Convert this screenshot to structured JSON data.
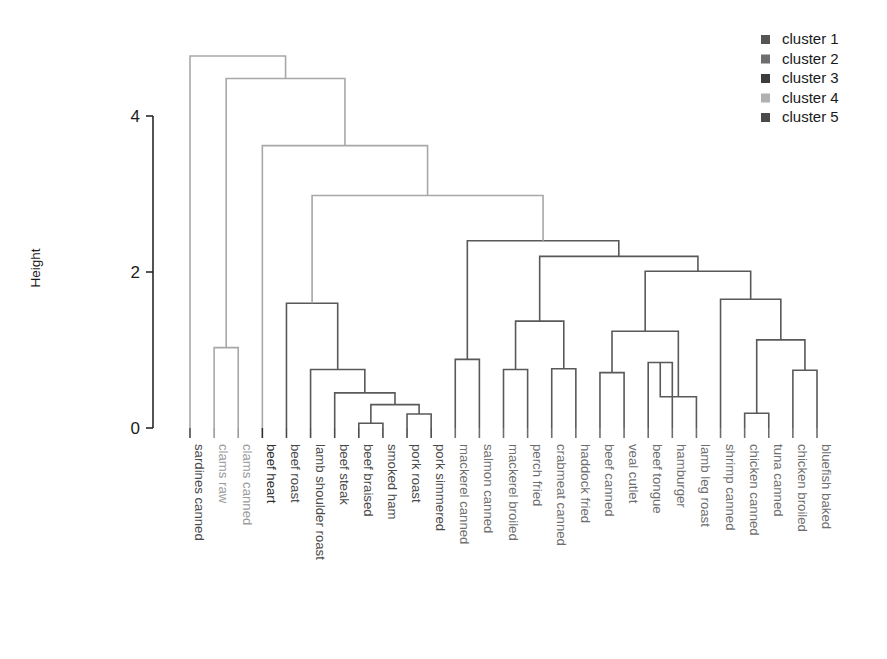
{
  "chart_data": {
    "type": "dendrogram",
    "title": "",
    "xlabel": "",
    "ylabel": "Height",
    "ylim": [
      0,
      5.0
    ],
    "yticks": [
      0,
      2,
      4
    ],
    "ytick_labels": [
      "0",
      "2",
      "4"
    ],
    "grid": false,
    "legend_position": "top-right",
    "cluster_colors": {
      "cluster 1": "#555555",
      "cluster 2": "#6e6e6e",
      "cluster 3": "#3c3c3c",
      "cluster 4": "#b0b0b0",
      "cluster 5": "#4a4a4a",
      "link_upper": "#a8a8a8",
      "link_lower": "#595959"
    },
    "legend": [
      {
        "label": "cluster 1",
        "color": "#555555"
      },
      {
        "label": "cluster 2",
        "color": "#6e6e6e"
      },
      {
        "label": "cluster 3",
        "color": "#3c3c3c"
      },
      {
        "label": "cluster 4",
        "color": "#b0b0b0"
      },
      {
        "label": "cluster 5",
        "color": "#4a4a4a"
      }
    ],
    "leaves": [
      {
        "label": "sardines canned",
        "cluster": 1,
        "color": "#4a4a4a"
      },
      {
        "label": "clams raw",
        "cluster": 4,
        "color": "#9a9a9a"
      },
      {
        "label": "clams canned",
        "cluster": 4,
        "color": "#9a9a9a"
      },
      {
        "label": "beef heart",
        "cluster": 3,
        "color": "#2e2e2e"
      },
      {
        "label": "beef roast",
        "cluster": 1,
        "color": "#4a4a4a"
      },
      {
        "label": "lamb shoulder roast",
        "cluster": 1,
        "color": "#4a4a4a"
      },
      {
        "label": "beef steak",
        "cluster": 1,
        "color": "#4a4a4a"
      },
      {
        "label": "beef braised",
        "cluster": 1,
        "color": "#4a4a4a"
      },
      {
        "label": "smoked ham",
        "cluster": 1,
        "color": "#4a4a4a"
      },
      {
        "label": "pork roast",
        "cluster": 1,
        "color": "#4a4a4a"
      },
      {
        "label": "pork simmered",
        "cluster": 1,
        "color": "#4a4a4a"
      },
      {
        "label": "mackerel canned",
        "cluster": 2,
        "color": "#6e6e6e"
      },
      {
        "label": "salmon canned",
        "cluster": 2,
        "color": "#6e6e6e"
      },
      {
        "label": "mackerel broiled",
        "cluster": 2,
        "color": "#6e6e6e"
      },
      {
        "label": "perch fried",
        "cluster": 2,
        "color": "#6e6e6e"
      },
      {
        "label": "crabmeat canned",
        "cluster": 2,
        "color": "#6e6e6e"
      },
      {
        "label": "haddock fried",
        "cluster": 2,
        "color": "#6e6e6e"
      },
      {
        "label": "beef canned",
        "cluster": 2,
        "color": "#6e6e6e"
      },
      {
        "label": "veal cutlet",
        "cluster": 2,
        "color": "#6e6e6e"
      },
      {
        "label": "beef tongue",
        "cluster": 2,
        "color": "#6e6e6e"
      },
      {
        "label": "hamburger",
        "cluster": 2,
        "color": "#6e6e6e"
      },
      {
        "label": "lamb leg roast",
        "cluster": 2,
        "color": "#6e6e6e"
      },
      {
        "label": "shrimp canned",
        "cluster": 2,
        "color": "#6e6e6e"
      },
      {
        "label": "chicken canned",
        "cluster": 2,
        "color": "#6e6e6e"
      },
      {
        "label": "tuna canned",
        "cluster": 2,
        "color": "#6e6e6e"
      },
      {
        "label": "chicken broiled",
        "cluster": 2,
        "color": "#6e6e6e"
      },
      {
        "label": "bluefish baked",
        "cluster": 2,
        "color": "#6e6e6e"
      }
    ],
    "merges": [
      {
        "id": "m1",
        "left": {
          "leaf": 1
        },
        "right": {
          "leaf": 2
        },
        "height": 1.03,
        "shade": "upper"
      },
      {
        "id": "m2",
        "left": {
          "leaf": 7
        },
        "right": {
          "leaf": 8
        },
        "height": 0.06,
        "shade": "lower"
      },
      {
        "id": "m3",
        "left": {
          "leaf": 9
        },
        "right": {
          "leaf": 10
        },
        "height": 0.18,
        "shade": "lower"
      },
      {
        "id": "m4",
        "left": {
          "node": "m2"
        },
        "right": {
          "node": "m3"
        },
        "height": 0.3,
        "shade": "lower"
      },
      {
        "id": "m5",
        "left": {
          "leaf": 6
        },
        "right": {
          "node": "m4"
        },
        "height": 0.45,
        "shade": "lower"
      },
      {
        "id": "m6",
        "left": {
          "leaf": 5
        },
        "right": {
          "node": "m5"
        },
        "height": 0.75,
        "shade": "lower"
      },
      {
        "id": "m7",
        "left": {
          "leaf": 4
        },
        "right": {
          "node": "m6"
        },
        "height": 1.6,
        "shade": "lower"
      },
      {
        "id": "m8",
        "left": {
          "leaf": 11
        },
        "right": {
          "leaf": 12
        },
        "height": 0.88,
        "shade": "lower"
      },
      {
        "id": "m9",
        "left": {
          "leaf": 13
        },
        "right": {
          "leaf": 14
        },
        "height": 0.75,
        "shade": "lower"
      },
      {
        "id": "m10",
        "left": {
          "leaf": 15
        },
        "right": {
          "leaf": 16
        },
        "height": 0.76,
        "shade": "lower"
      },
      {
        "id": "m11",
        "left": {
          "node": "m9"
        },
        "right": {
          "node": "m10"
        },
        "height": 1.37,
        "shade": "lower"
      },
      {
        "id": "m12",
        "left": {
          "leaf": 17
        },
        "right": {
          "leaf": 18
        },
        "height": 0.71,
        "shade": "lower"
      },
      {
        "id": "m13",
        "left": {
          "leaf": 19
        },
        "right": {
          "leaf": 20
        },
        "height": 0.84,
        "shade": "lower"
      },
      {
        "id": "m14",
        "left": {
          "node": "m13"
        },
        "right": {
          "leaf": 21
        },
        "height": 0.4,
        "shade": "lower"
      },
      {
        "id": "m15",
        "left": {
          "node": "m12"
        },
        "right": {
          "node": "m14"
        },
        "height": 1.24,
        "shade": "lower"
      },
      {
        "id": "m16",
        "left": {
          "leaf": 23
        },
        "right": {
          "leaf": 24
        },
        "height": 0.19,
        "shade": "lower"
      },
      {
        "id": "m17",
        "left": {
          "leaf": 25
        },
        "right": {
          "leaf": 26
        },
        "height": 0.74,
        "shade": "lower"
      },
      {
        "id": "m18",
        "left": {
          "node": "m16"
        },
        "right": {
          "node": "m17"
        },
        "height": 1.13,
        "shade": "lower"
      },
      {
        "id": "m19",
        "left": {
          "leaf": 22
        },
        "right": {
          "node": "m18"
        },
        "height": 1.65,
        "shade": "lower"
      },
      {
        "id": "m20",
        "left": {
          "node": "m15"
        },
        "right": {
          "node": "m19"
        },
        "height": 2.01,
        "shade": "lower"
      },
      {
        "id": "m21",
        "left": {
          "node": "m11"
        },
        "right": {
          "node": "m20"
        },
        "height": 2.2,
        "shade": "lower"
      },
      {
        "id": "m22",
        "left": {
          "node": "m8"
        },
        "right": {
          "node": "m21"
        },
        "height": 2.4,
        "shade": "lower"
      },
      {
        "id": "m23",
        "left": {
          "node": "m7"
        },
        "right": {
          "node": "m22"
        },
        "height": 2.98,
        "shade": "upper"
      },
      {
        "id": "m24",
        "left": {
          "leaf": 3
        },
        "right": {
          "node": "m23"
        },
        "height": 3.62,
        "shade": "upper"
      },
      {
        "id": "m25",
        "left": {
          "node": "m1"
        },
        "right": {
          "node": "m24"
        },
        "height": 4.48,
        "shade": "upper"
      },
      {
        "id": "m26",
        "left": {
          "leaf": 0
        },
        "right": {
          "node": "m25"
        },
        "height": 4.77,
        "shade": "upper"
      }
    ],
    "layout": {
      "plot_left": 190,
      "plot_right": 817,
      "baseline_y": 432,
      "y_zero": 428,
      "y_two": 272,
      "y_four": 112,
      "leaf_spacing": 24.1,
      "axis_x": 125,
      "label_top": 444
    }
  },
  "axis": {
    "ylabel": "Height",
    "ticks": [
      "4",
      "2",
      "0"
    ]
  }
}
